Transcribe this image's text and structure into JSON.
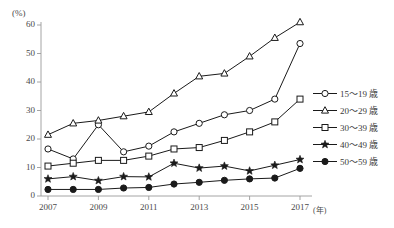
{
  "chart_data": {
    "type": "line",
    "title": "",
    "xlabel": "年",
    "ylabel": "(%)",
    "unit_label": "(%)",
    "x_unit_label": "(年)",
    "x": [
      2007,
      2008,
      2009,
      2010,
      2011,
      2012,
      2013,
      2014,
      2015,
      2016,
      2017
    ],
    "x_tick_labels": [
      "2007",
      "2009",
      "2011",
      "2013",
      "2015",
      "2017"
    ],
    "x_ticks": [
      2007,
      2009,
      2011,
      2013,
      2015,
      2017
    ],
    "y_tick_labels": [
      "0",
      "10",
      "20",
      "30",
      "40",
      "50",
      "60"
    ],
    "y_ticks": [
      0,
      10,
      20,
      30,
      40,
      50,
      60
    ],
    "ylim": [
      0,
      60
    ],
    "xlim": [
      2006.5,
      2017.5
    ],
    "grid": false,
    "legend_position": "right",
    "series": [
      {
        "name": "15～19 歳",
        "marker": "circle-open",
        "color": "#1a1a1a",
        "values": [
          16.5,
          13.0,
          25.0,
          15.5,
          17.5,
          22.5,
          25.5,
          28.5,
          30.0,
          34.0,
          53.5
        ]
      },
      {
        "name": "20～29 歳",
        "marker": "triangle-open",
        "color": "#1a1a1a",
        "values": [
          21.5,
          25.5,
          26.5,
          28.0,
          29.5,
          36.0,
          42.0,
          43.0,
          49.0,
          55.5,
          61.0
        ]
      },
      {
        "name": "30～39 歳",
        "marker": "square-open",
        "color": "#1a1a1a",
        "values": [
          10.5,
          11.5,
          12.5,
          12.5,
          14.0,
          16.5,
          17.0,
          19.5,
          22.5,
          26.0,
          34.0
        ]
      },
      {
        "name": "40～49 歳",
        "marker": "star-filled",
        "color": "#1a1a1a",
        "values": [
          6.0,
          6.8,
          5.4,
          6.8,
          6.7,
          11.5,
          9.8,
          10.5,
          8.8,
          10.8,
          12.8
        ]
      },
      {
        "name": "50～59 歳",
        "marker": "circle-filled",
        "color": "#1a1a1a",
        "values": [
          2.3,
          2.3,
          2.3,
          2.8,
          3.0,
          4.2,
          4.8,
          5.5,
          6.0,
          6.3,
          9.7
        ]
      }
    ]
  },
  "legend": {
    "items": [
      {
        "label": "15～19 歳",
        "marker": "circle-open"
      },
      {
        "label": "20～29 歳",
        "marker": "triangle-open"
      },
      {
        "label": "30～39 歳",
        "marker": "square-open"
      },
      {
        "label": "40～49 歳",
        "marker": "star-filled"
      },
      {
        "label": "50～59 歳",
        "marker": "circle-filled"
      }
    ]
  },
  "axes": {
    "y_unit": "(%)",
    "x_unit": "(年)"
  }
}
